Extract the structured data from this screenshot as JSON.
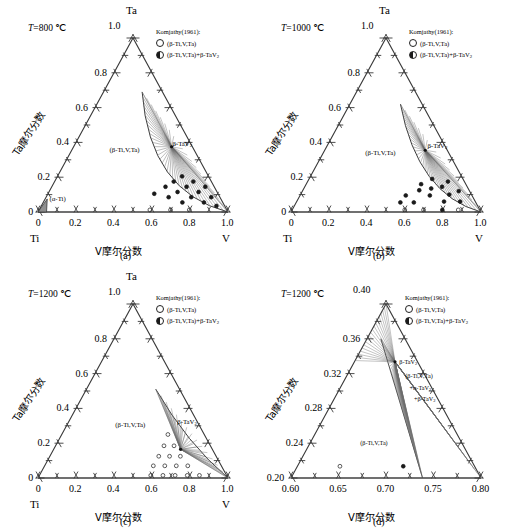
{
  "figure": {
    "width": 506,
    "height": 532,
    "panel_count": 4
  },
  "legend": {
    "title": "Komjathy(1961):",
    "items": [
      {
        "marker": "open-circle",
        "label": "(β-Ti,V,Ta)"
      },
      {
        "marker": "half-filled-circle",
        "label": "(β-Ti,V,Ta)+β-TaV₂"
      }
    ]
  },
  "axis_titles": {
    "x": "V摩尔分数",
    "y": "Ta摩尔分数"
  },
  "colors": {
    "line": "#3a3a3a",
    "tieline": "#6b6b6b",
    "text": "#000000",
    "background": "#ffffff",
    "alpha_ti_fill": "#8f8f8f"
  },
  "panels": [
    {
      "id": "a",
      "caption": "(a)",
      "temperature": "=800 ℃",
      "temperature_symbol": "T",
      "apex_label": "Ta",
      "left_corner_label": "Ti",
      "right_corner_label": "V",
      "xticks": [
        "0",
        "0.2",
        "0.4",
        "0.6",
        "0.8",
        "1.0"
      ],
      "yticks": [
        "0",
        "0.2",
        "0.4",
        "0.6",
        "0.8",
        "1.0"
      ],
      "xlim": [
        0,
        1
      ],
      "ylim": [
        0,
        1
      ],
      "phase_labels": [
        {
          "text": "(β-Ti,V,Ta)",
          "x": 0.3,
          "y": 0.38
        },
        {
          "text": "(α-Ti)",
          "x": 0.012,
          "y": 0.1
        },
        {
          "text": "β-TaV₂",
          "x": 0.855,
          "y": 0.415
        }
      ],
      "tie_apex": {
        "x": 0.825,
        "y": 0.375
      },
      "boundary_top": {
        "x": 0.655,
        "y": 0.69
      },
      "boundary_bottom": {
        "x": 1.0,
        "y": 0.0
      },
      "boundary_bulge": {
        "x": 0.6,
        "y": 0.115
      },
      "tieline_count": 34,
      "data_points": [
        {
          "x": 0.625,
          "y": 0.105,
          "type": "half"
        },
        {
          "x": 0.7,
          "y": 0.145,
          "type": "half"
        },
        {
          "x": 0.705,
          "y": 0.085,
          "type": "half"
        },
        {
          "x": 0.76,
          "y": 0.175,
          "type": "half"
        },
        {
          "x": 0.765,
          "y": 0.115,
          "type": "half"
        },
        {
          "x": 0.775,
          "y": 0.055,
          "type": "half"
        },
        {
          "x": 0.825,
          "y": 0.205,
          "type": "half"
        },
        {
          "x": 0.83,
          "y": 0.145,
          "type": "half"
        },
        {
          "x": 0.835,
          "y": 0.085,
          "type": "half"
        },
        {
          "x": 0.885,
          "y": 0.175,
          "type": "half"
        },
        {
          "x": 0.89,
          "y": 0.115,
          "type": "half"
        },
        {
          "x": 0.895,
          "y": 0.055,
          "type": "half"
        },
        {
          "x": 0.945,
          "y": 0.145,
          "type": "half"
        },
        {
          "x": 0.95,
          "y": 0.085,
          "type": "half"
        },
        {
          "x": 0.955,
          "y": 0.035,
          "type": "half"
        },
        {
          "x": 0.59,
          "y": 0.012,
          "type": "open"
        },
        {
          "x": 0.7,
          "y": 0.012,
          "type": "open"
        },
        {
          "x": 0.8,
          "y": 0.012,
          "type": "open"
        }
      ]
    },
    {
      "id": "b",
      "caption": "(b)",
      "temperature": "=1000 ℃",
      "temperature_symbol": "T",
      "apex_label": "Ta",
      "left_corner_label": "Ti",
      "right_corner_label": "V",
      "xticks": [
        "0",
        "0.2",
        "0.4",
        "0.6",
        "0.8",
        "1.0"
      ],
      "yticks": [
        "0",
        "0.2",
        "0.4",
        "0.6",
        "0.8",
        "1.0"
      ],
      "xlim": [
        0,
        1
      ],
      "ylim": [
        0,
        1
      ],
      "phase_labels": [
        {
          "text": "(β-Ti,V,Ta)",
          "x": 0.33,
          "y": 0.36
        },
        {
          "text": "β-TaV₂",
          "x": 0.865,
          "y": 0.4
        }
      ],
      "tie_apex": {
        "x": 0.82,
        "y": 0.355
      },
      "boundary_top": {
        "x": 0.7,
        "y": 0.62
      },
      "boundary_bottom": {
        "x": 1.0,
        "y": 0.0
      },
      "boundary_bulge": {
        "x": 0.685,
        "y": 0.1
      },
      "tieline_count": 32,
      "data_points": [
        {
          "x": 0.58,
          "y": 0.055,
          "type": "half"
        },
        {
          "x": 0.615,
          "y": 0.095,
          "type": "half"
        },
        {
          "x": 0.655,
          "y": 0.055,
          "type": "half"
        },
        {
          "x": 0.7,
          "y": 0.125,
          "type": "half"
        },
        {
          "x": 0.72,
          "y": 0.16,
          "type": "half"
        },
        {
          "x": 0.755,
          "y": 0.095,
          "type": "half"
        },
        {
          "x": 0.775,
          "y": 0.135,
          "type": "half"
        },
        {
          "x": 0.8,
          "y": 0.19,
          "type": "half"
        },
        {
          "x": 0.825,
          "y": 0.06,
          "type": "half"
        },
        {
          "x": 0.845,
          "y": 0.145,
          "type": "half"
        },
        {
          "x": 0.87,
          "y": 0.1,
          "type": "half"
        },
        {
          "x": 0.895,
          "y": 0.175,
          "type": "half"
        },
        {
          "x": 0.915,
          "y": 0.06,
          "type": "half"
        },
        {
          "x": 0.935,
          "y": 0.12,
          "type": "half"
        },
        {
          "x": 0.6,
          "y": 0.012,
          "type": "open"
        },
        {
          "x": 0.7,
          "y": 0.012,
          "type": "open"
        },
        {
          "x": 0.8,
          "y": 0.012,
          "type": "half"
        },
        {
          "x": 0.885,
          "y": 0.012,
          "type": "open"
        }
      ]
    },
    {
      "id": "c",
      "caption": "(c)",
      "temperature": "=1200 ℃",
      "temperature_symbol": "T",
      "apex_label": "Ta",
      "left_corner_label": "Ti",
      "right_corner_label": "V",
      "xticks": [
        "0",
        "0.2",
        "0.4",
        "0.6",
        "0.8",
        "1.0"
      ],
      "yticks": [
        "0",
        "0.2",
        "0.4",
        "0.6",
        "0.8",
        "1.0"
      ],
      "xlim": [
        0,
        1
      ],
      "ylim": [
        0,
        1
      ],
      "phase_labels": [
        {
          "text": "(β-Ti,V,Ta)",
          "x": 0.36,
          "y": 0.33
        },
        {
          "text": "β-TaV₂",
          "x": 0.855,
          "y": 0.345
        }
      ],
      "tie_apex": {
        "x": 0.8,
        "y": 0.165
      },
      "boundary_top": {
        "x": 0.745,
        "y": 0.51
      },
      "boundary_bottom": {
        "x": 1.0,
        "y": 0.0
      },
      "boundary_bulge": {
        "x": 0.855,
        "y": 0.2
      },
      "tieline_count": 26,
      "data_points": [
        {
          "x": 0.595,
          "y": 0.015,
          "type": "open"
        },
        {
          "x": 0.66,
          "y": 0.015,
          "type": "open"
        },
        {
          "x": 0.725,
          "y": 0.015,
          "type": "open"
        },
        {
          "x": 0.79,
          "y": 0.015,
          "type": "open"
        },
        {
          "x": 0.855,
          "y": 0.015,
          "type": "open"
        },
        {
          "x": 0.615,
          "y": 0.07,
          "type": "open"
        },
        {
          "x": 0.68,
          "y": 0.07,
          "type": "open"
        },
        {
          "x": 0.745,
          "y": 0.07,
          "type": "open"
        },
        {
          "x": 0.81,
          "y": 0.07,
          "type": "open"
        },
        {
          "x": 0.655,
          "y": 0.125,
          "type": "open"
        },
        {
          "x": 0.72,
          "y": 0.125,
          "type": "open"
        },
        {
          "x": 0.785,
          "y": 0.125,
          "type": "open"
        },
        {
          "x": 0.7,
          "y": 0.185,
          "type": "open"
        },
        {
          "x": 0.765,
          "y": 0.185,
          "type": "open"
        },
        {
          "x": 0.745,
          "y": 0.25,
          "type": "open"
        }
      ]
    },
    {
      "id": "d",
      "caption": "(d)",
      "temperature": "=1200 ℃",
      "temperature_symbol": "T",
      "apex_label": "0.40",
      "left_corner_label": "",
      "right_corner_label": "",
      "xticks": [
        "0.60",
        "0.65",
        "0.70",
        "0.75",
        "0.80"
      ],
      "yticks": [
        "0.20",
        "0.24",
        "0.28",
        "0.32",
        "0.36",
        "0.40"
      ],
      "xlim": [
        0.6,
        0.8
      ],
      "ylim": [
        0.2,
        0.4
      ],
      "phase_labels": [
        {
          "text": "(β-Ti,V,Ta)",
          "x": 0.665,
          "y": 0.245
        },
        {
          "text": "β-TaV₂",
          "x": 0.745,
          "y": 0.338
        },
        {
          "text": "(β-Ti,V,Ta)",
          "x": 0.752,
          "y": 0.322
        },
        {
          "text": "+α-TaV₂",
          "x": 0.754,
          "y": 0.308
        },
        {
          "text": "+β-TaV₂",
          "x": 0.756,
          "y": 0.295
        }
      ],
      "tie_apex": {
        "x": 0.7285,
        "y": 0.3335
      },
      "tieline_count": 40,
      "data_points": [
        {
          "x": 0.648,
          "y": 0.2135,
          "type": "open"
        },
        {
          "x": 0.7195,
          "y": 0.2135,
          "type": "half"
        }
      ]
    }
  ]
}
